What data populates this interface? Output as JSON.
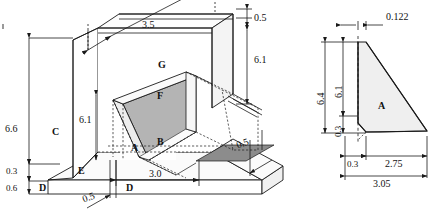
{
  "drawing": {
    "title": "Counterfort retaining wall - isometric and side elevation",
    "colors": {
      "line": "#1a1a1a",
      "fill_light": "#f2f2f2",
      "fill_mid": "#b4b4b4",
      "fill_dark": "#8c8c8c",
      "fill_face": "#e8e8e8",
      "background": "#ffffff"
    }
  },
  "iso_view": {
    "name": "isometric-view",
    "face_labels": [
      {
        "id": "A",
        "text": "A"
      },
      {
        "id": "B",
        "text": "B"
      },
      {
        "id": "C",
        "text": "C"
      },
      {
        "id": "D1",
        "text": "D"
      },
      {
        "id": "D2",
        "text": "D"
      },
      {
        "id": "E",
        "text": "E"
      },
      {
        "id": "F",
        "text": "F"
      },
      {
        "id": "G",
        "text": "G"
      }
    ],
    "dimensions": [
      {
        "id": "top-span",
        "text": "3.5"
      },
      {
        "id": "top-thickness",
        "text": "0.5"
      },
      {
        "id": "stem-height-right",
        "text": "6.1"
      },
      {
        "id": "stem-height-left",
        "text": "6.1"
      },
      {
        "id": "wall-height",
        "text": "6.6"
      },
      {
        "id": "heel-step",
        "text": "0.3"
      },
      {
        "id": "base-thickness",
        "text": "0.6"
      },
      {
        "id": "base-length",
        "text": "3.0"
      },
      {
        "id": "edge-left",
        "text": "0.5"
      },
      {
        "id": "edge-right",
        "text": "0.5"
      }
    ]
  },
  "side_view": {
    "name": "side-elevation-view",
    "face_labels": [
      {
        "id": "A",
        "text": "A"
      }
    ],
    "dimensions": [
      {
        "id": "top-width",
        "text": "0.122"
      },
      {
        "id": "overall-height",
        "text": "6.4"
      },
      {
        "id": "stem-height",
        "text": "6.1"
      },
      {
        "id": "toe-height",
        "text": "0.3"
      },
      {
        "id": "toe-width",
        "text": "0.3"
      },
      {
        "id": "heel-width",
        "text": "2.75"
      },
      {
        "id": "overall-width",
        "text": "3.05"
      }
    ]
  }
}
